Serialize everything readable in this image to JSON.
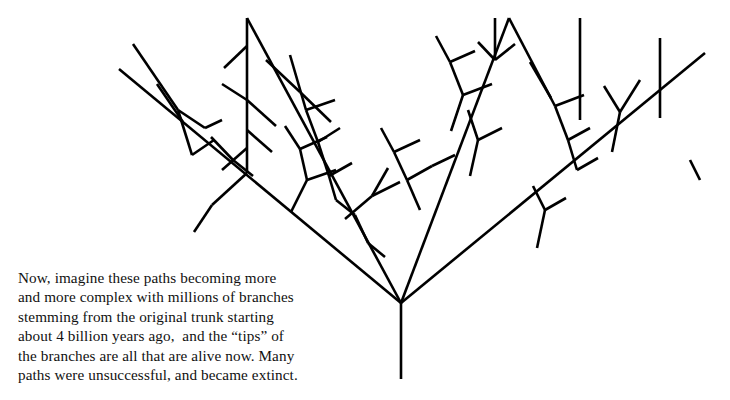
{
  "figure": {
    "stroke_color": "#000000",
    "background_color": "#ffffff",
    "stroke_width": 2.6,
    "trunk_label": "original trunk",
    "root_junction": {
      "x": 401,
      "y": 303
    },
    "trunk_base": {
      "x": 401,
      "y": 379
    }
  },
  "caption": {
    "lines": [
      "Now, imagine these paths becoming more",
      "and more complex with millions of branches",
      "stemming from the original trunk starting",
      "about 4 billion years ago,  and the “tips” of",
      "the branches are all that are alive now. Many",
      "paths were unsuccessful, and became extinct."
    ],
    "full_text": "Now, imagine these paths becoming more and more complex with millions of branches stemming from the original trunk starting about 4 billion years ago, and the “tips” of the branches are all that are alive now. Many paths were unsuccessful, and became extinct."
  },
  "chart_data": {
    "type": "diagram",
    "segments": [
      [
        401,
        379,
        401,
        303
      ],
      [
        401,
        303,
        119,
        69
      ],
      [
        401,
        303,
        247,
        18
      ],
      [
        401,
        303,
        509,
        18
      ],
      [
        401,
        303,
        705,
        53
      ],
      [
        247,
        173,
        212,
        205
      ],
      [
        212,
        205,
        194,
        232
      ],
      [
        331,
        122,
        300,
        92
      ],
      [
        300,
        92,
        266,
        60
      ],
      [
        247,
        18,
        247,
        173
      ],
      [
        247,
        46,
        224,
        68
      ],
      [
        247,
        100,
        222,
        84
      ],
      [
        247,
        100,
        276,
        126
      ],
      [
        247,
        130,
        272,
        152
      ],
      [
        247,
        148,
        222,
        170
      ],
      [
        133,
        44,
        178,
        110
      ],
      [
        178,
        110,
        192,
        155
      ],
      [
        178,
        110,
        205,
        128
      ],
      [
        157,
        84,
        183,
        122
      ],
      [
        205,
        128,
        222,
        120
      ],
      [
        192,
        155,
        214,
        140
      ],
      [
        211,
        137,
        233,
        160
      ],
      [
        233,
        160,
        253,
        176
      ],
      [
        290,
        55,
        306,
        110
      ],
      [
        306,
        110,
        318,
        142
      ],
      [
        306,
        110,
        335,
        100
      ],
      [
        318,
        142,
        340,
        128
      ],
      [
        318,
        142,
        329,
        176
      ],
      [
        329,
        176,
        352,
        163
      ],
      [
        329,
        176,
        336,
        200
      ],
      [
        291,
        212,
        307,
        180
      ],
      [
        307,
        180,
        300,
        149
      ],
      [
        307,
        180,
        336,
        170
      ],
      [
        300,
        149,
        285,
        126
      ],
      [
        300,
        149,
        327,
        137
      ],
      [
        336,
        200,
        355,
        215
      ],
      [
        355,
        215,
        368,
        243
      ],
      [
        345,
        219,
        372,
        196
      ],
      [
        372,
        196,
        388,
        168
      ],
      [
        372,
        196,
        400,
        182
      ],
      [
        368,
        243,
        385,
        257
      ],
      [
        420,
        210,
        407,
        180
      ],
      [
        407,
        180,
        394,
        152
      ],
      [
        407,
        180,
        432,
        166
      ],
      [
        394,
        152,
        381,
        128
      ],
      [
        394,
        152,
        420,
        140
      ],
      [
        432,
        166,
        455,
        155
      ],
      [
        451,
        131,
        463,
        95
      ],
      [
        463,
        95,
        450,
        62
      ],
      [
        463,
        95,
        492,
        84
      ],
      [
        450,
        62,
        436,
        36
      ],
      [
        450,
        62,
        475,
        51
      ],
      [
        470,
        176,
        478,
        140
      ],
      [
        478,
        140,
        468,
        110
      ],
      [
        478,
        140,
        502,
        128
      ],
      [
        495,
        18,
        495,
        60
      ],
      [
        495,
        60,
        478,
        42
      ],
      [
        495,
        60,
        515,
        44
      ],
      [
        509,
        18,
        555,
        106
      ],
      [
        555,
        106,
        568,
        140
      ],
      [
        555,
        106,
        584,
        95
      ],
      [
        568,
        140,
        590,
        128
      ],
      [
        568,
        140,
        577,
        170
      ],
      [
        577,
        170,
        598,
        158
      ],
      [
        530,
        62,
        551,
        98
      ],
      [
        537,
        248,
        545,
        210
      ],
      [
        545,
        210,
        533,
        186
      ],
      [
        545,
        210,
        566,
        198
      ],
      [
        580,
        18,
        580,
        120
      ],
      [
        612,
        152,
        620,
        112
      ],
      [
        620,
        112,
        604,
        86
      ],
      [
        620,
        112,
        640,
        80
      ],
      [
        660,
        38,
        660,
        118
      ],
      [
        700,
        180,
        690,
        160
      ]
    ]
  }
}
